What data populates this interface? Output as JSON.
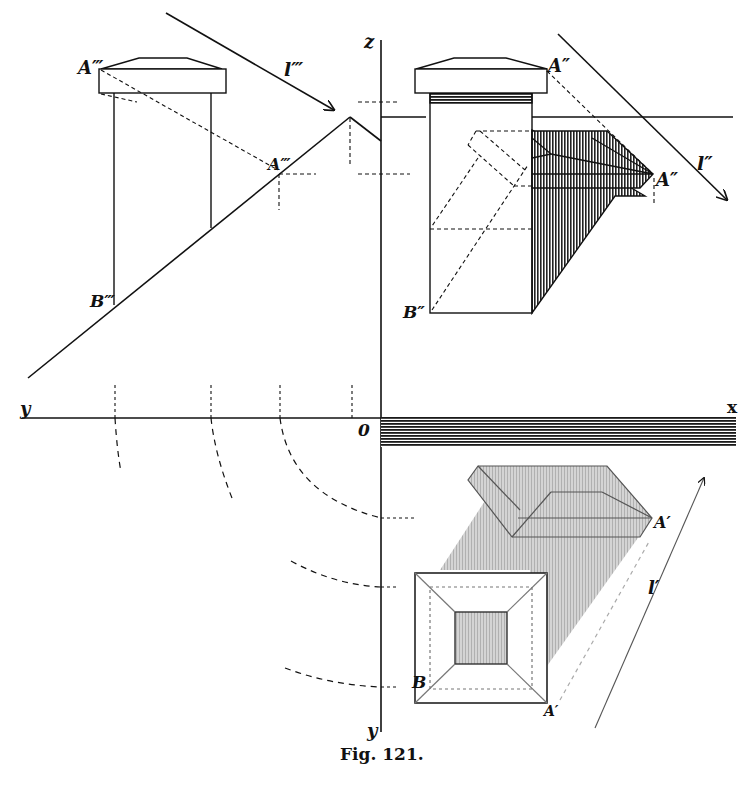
{
  "figure": {
    "caption": "Fig. 121.",
    "type": "descriptive geometry — shadow construction of a square pillar with cap (three projections)"
  },
  "axes": {
    "z": "z",
    "y_left": "y",
    "x": "x",
    "origin": "0",
    "y_bottom": "y"
  },
  "labels": {
    "A_side": "A‴",
    "A_side_shadow": "A‴",
    "A_side_shadow_sub": "*",
    "B_side": "B‴",
    "l_side": "l‴",
    "A_front": "A″",
    "A_front_shadow": "A″",
    "A_front_shadow_sub": "*",
    "B_front": "B″",
    "l_front": "l″",
    "A_plan_shadow": "A′",
    "A_plan_shadow_sub": "*",
    "A_plan": "A′",
    "B_plan": "B",
    "l_plan": "l′"
  },
  "views": [
    {
      "name": "side-elevation",
      "position": "upper-left"
    },
    {
      "name": "front-elevation",
      "position": "upper-right"
    },
    {
      "name": "plan-view",
      "position": "lower-right"
    }
  ],
  "colors": {
    "ink": "#111111",
    "shade_dark": "#2a2a2a",
    "shade_light": "#bdbdbd",
    "background": "#ffffff"
  }
}
